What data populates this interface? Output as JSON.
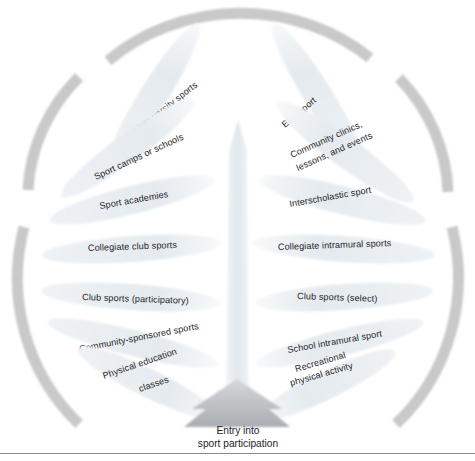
{
  "figure": {
    "entry_label_line1": "Entry into",
    "entry_label_line2": "sport participation",
    "colors": {
      "leaf_fill": "#e5eaef",
      "leaf_fill_edge": "#f4f7f9",
      "arc_gray": "#c9c9c9",
      "trunk_gray": "#e9ecef",
      "arrow_gray": "#b9bdc1",
      "text": "#1d1d1f",
      "rule": "#8b8b8b",
      "background": "#ffffff"
    }
  },
  "branches": {
    "left": [
      {
        "id": "collegiate-varsity-sports",
        "label": "Collegiate varsity sports",
        "lines": [
          "Collegiate varsity sports"
        ],
        "level": 1,
        "angle_deg": -58
      },
      {
        "id": "sport-camps-or-schools",
        "label": "Sport camps or schools",
        "lines": [
          "Sport camps or schools"
        ],
        "level": 2,
        "angle_deg": -36
      },
      {
        "id": "sport-academies",
        "label": "Sport academies",
        "lines": [
          "Sport academies"
        ],
        "level": 3,
        "angle_deg": -19
      },
      {
        "id": "collegiate-club-sports",
        "label": "Collegiate club sports",
        "lines": [
          "Collegiate club sports"
        ],
        "level": 4,
        "angle_deg": -5
      },
      {
        "id": "club-sports-participatory",
        "label": "Club sports (participatory)",
        "lines": [
          "Club sports (participatory)"
        ],
        "level": 5,
        "angle_deg": 6
      },
      {
        "id": "community-sponsored-sports",
        "label": "Community-sponsored sports",
        "lines": [
          "Community-sponsored sports"
        ],
        "level": 6,
        "angle_deg": 19
      },
      {
        "id": "physical-education-classes",
        "label": "Physical education classes",
        "lines": [
          "Physical education",
          "classes"
        ],
        "level": 7,
        "angle_deg": 31
      }
    ],
    "right": [
      {
        "id": "elite-sport",
        "label": "Elite sport",
        "lines": [
          "Elite sport"
        ],
        "level": 1,
        "angle_deg": 58
      },
      {
        "id": "community-clinics-lessons-and-events",
        "label": "Community clinics, lessons, and events",
        "lines": [
          "Community clinics,",
          "lessons, and events"
        ],
        "level": 2,
        "angle_deg": 36
      },
      {
        "id": "interscholastic-sport",
        "label": "Interscholastic sport",
        "lines": [
          "Interscholastic sport"
        ],
        "level": 3,
        "angle_deg": 19
      },
      {
        "id": "collegiate-intramural-sports",
        "label": "Collegiate intramural sports",
        "lines": [
          "Collegiate intramural sports"
        ],
        "level": 4,
        "angle_deg": 5
      },
      {
        "id": "club-sports-select",
        "label": "Club sports (select)",
        "lines": [
          "Club sports (select)"
        ],
        "level": 5,
        "angle_deg": -6
      },
      {
        "id": "school-intramural-sport",
        "label": "School intramural sport",
        "lines": [
          "School intramural sport"
        ],
        "level": 6,
        "angle_deg": -19
      },
      {
        "id": "recreational-physical-activity",
        "label": "Recreational physical activity",
        "lines": [
          "Recreational",
          "physical activity"
        ],
        "level": 7,
        "angle_deg": -31
      }
    ]
  },
  "arcs": [
    {
      "id": "arc-top",
      "position": "top"
    },
    {
      "id": "arc-upper-left",
      "position": "upper-left"
    },
    {
      "id": "arc-upper-right",
      "position": "upper-right"
    },
    {
      "id": "arc-lower-left",
      "position": "lower-left"
    },
    {
      "id": "arc-lower-right",
      "position": "lower-right"
    }
  ]
}
